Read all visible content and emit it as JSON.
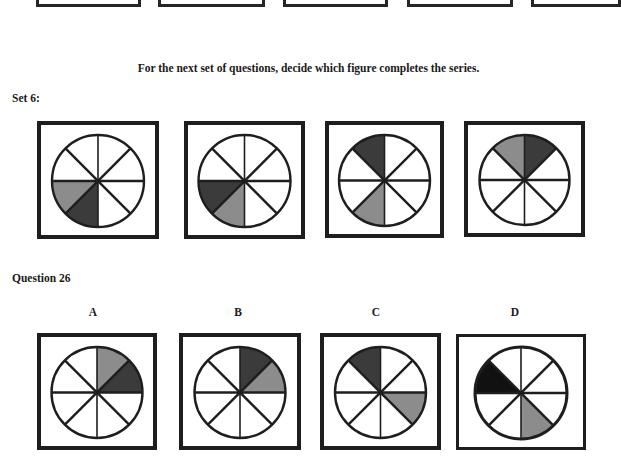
{
  "heading": "For the next set of questions, decide which figure completes the series.",
  "set_label": "Set 6:",
  "question_label": "Question 26",
  "colors": {
    "dark": "#3b3b3b",
    "gray": "#8c8c8c",
    "black": "#111111",
    "stroke": "#1e1e1e"
  },
  "previous_row_boxes": [
    {
      "x": 36,
      "w": 105
    },
    {
      "x": 158,
      "w": 107
    },
    {
      "x": 283,
      "w": 105
    },
    {
      "x": 407,
      "w": 106
    },
    {
      "x": 531,
      "w": 90
    }
  ],
  "series": [
    {
      "id": "fig-1",
      "x": 37,
      "y": 121,
      "w": 122,
      "h": 118,
      "border": 4,
      "shaded": [
        {
          "from": 180,
          "to": 135,
          "fill": "gray"
        },
        {
          "from": 135,
          "to": 90,
          "fill": "dark"
        }
      ]
    },
    {
      "id": "fig-2",
      "x": 184,
      "y": 121,
      "w": 121,
      "h": 118,
      "border": 4,
      "shaded": [
        {
          "from": 180,
          "to": 135,
          "fill": "dark"
        },
        {
          "from": 135,
          "to": 90,
          "fill": "gray"
        }
      ]
    },
    {
      "id": "fig-3",
      "x": 325,
      "y": 121,
      "w": 119,
      "h": 117,
      "border": 4,
      "shaded": [
        {
          "from": 225,
          "to": 270,
          "fill": "dark"
        },
        {
          "from": 135,
          "to": 90,
          "fill": "gray"
        }
      ]
    },
    {
      "id": "fig-4",
      "x": 464,
      "y": 121,
      "w": 121,
      "h": 116,
      "border": 4,
      "shaded": [
        {
          "from": 225,
          "to": 270,
          "fill": "gray"
        },
        {
          "from": 270,
          "to": 315,
          "fill": "dark"
        }
      ]
    }
  ],
  "options": [
    {
      "letter": "A",
      "label_x": 83,
      "x": 37,
      "y": 333,
      "w": 120,
      "h": 117,
      "border": 4,
      "shaded": [
        {
          "from": 270,
          "to": 315,
          "fill": "gray"
        },
        {
          "from": 315,
          "to": 360,
          "fill": "dark"
        }
      ]
    },
    {
      "letter": "B",
      "label_x": 228,
      "x": 179,
      "y": 333,
      "w": 122,
      "h": 117,
      "border": 4,
      "shaded": [
        {
          "from": 270,
          "to": 315,
          "fill": "dark"
        },
        {
          "from": 315,
          "to": 360,
          "fill": "gray"
        }
      ]
    },
    {
      "letter": "C",
      "label_x": 366,
      "x": 320,
      "y": 333,
      "w": 121,
      "h": 117,
      "border": 4,
      "shaded": [
        {
          "from": 225,
          "to": 270,
          "fill": "dark"
        },
        {
          "from": 0,
          "to": 45,
          "fill": "gray"
        }
      ]
    },
    {
      "letter": "D",
      "label_x": 505,
      "x": 456,
      "y": 334,
      "w": 130,
      "h": 116,
      "border": 3,
      "shaded": [
        {
          "from": 180,
          "to": 225,
          "fill": "black"
        },
        {
          "from": 90,
          "to": 45,
          "fill": "gray"
        }
      ]
    }
  ]
}
